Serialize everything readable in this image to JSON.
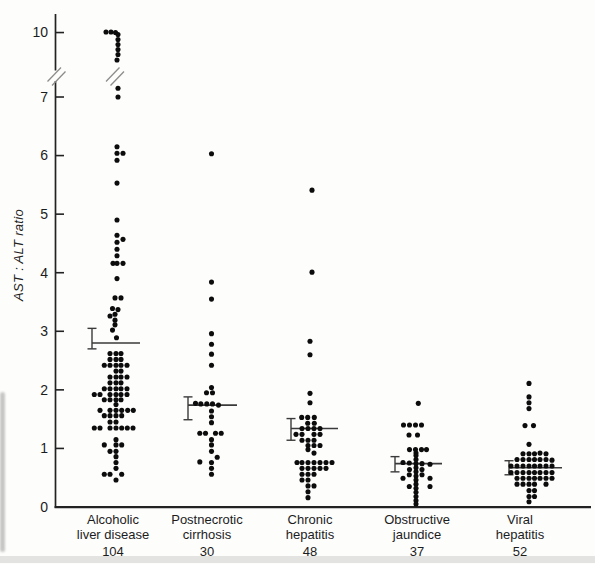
{
  "chart_data": {
    "type": "scatter",
    "title": "",
    "xlabel": "",
    "ylabel": "AST : ALT ratio",
    "ylim": [
      0,
      10.3
    ],
    "grid": false,
    "y_ticks": [
      10,
      7,
      6,
      5,
      4,
      3,
      2,
      1,
      0
    ],
    "axis_break": {
      "between": [
        7,
        10
      ]
    },
    "legend": "none",
    "groups": [
      {
        "label": [
          "Alcoholic",
          "liver disease"
        ],
        "n": "104",
        "label_x": 113,
        "center_x": 116,
        "mean": 2.8,
        "err_low": 2.7,
        "err_high": 3.05,
        "errorbar_x": 92,
        "mean_line_end_x": 140,
        "points": [
          [
            -10,
            10.05
          ],
          [
            -5,
            10.05
          ],
          [
            -0.5,
            10.0
          ],
          [
            2,
            9.82
          ],
          [
            2,
            9.37
          ],
          [
            2,
            8.91
          ],
          [
            2,
            8.46
          ],
          [
            2,
            8.0
          ],
          [
            1,
            7.5
          ],
          [
            2,
            7.15
          ],
          [
            2,
            7.0
          ],
          [
            1,
            6.15
          ],
          [
            1,
            6.04
          ],
          [
            7,
            6.04
          ],
          [
            1,
            5.92
          ],
          [
            1,
            5.53
          ],
          [
            1,
            4.9
          ],
          [
            1,
            4.64
          ],
          [
            7,
            4.57
          ],
          [
            1,
            4.52
          ],
          [
            1,
            4.4
          ],
          [
            1,
            4.29
          ],
          [
            -3,
            4.16
          ],
          [
            1,
            4.16
          ],
          [
            7,
            4.16
          ],
          [
            1,
            3.9
          ],
          [
            -1,
            3.57
          ],
          [
            5,
            3.57
          ],
          [
            -3.5,
            3.39
          ],
          [
            2,
            3.37
          ],
          [
            -1,
            3.29
          ],
          [
            -6,
            3.26
          ],
          [
            -1,
            3.19
          ],
          [
            -1,
            3.11
          ],
          [
            -3.5,
            3.02
          ],
          [
            0.5,
            2.89
          ],
          [
            -6,
            2.62
          ],
          [
            0,
            2.62
          ],
          [
            5,
            2.62
          ],
          [
            -6,
            2.52
          ],
          [
            0,
            2.52
          ],
          [
            5,
            2.52
          ],
          [
            -11.7,
            2.42
          ],
          [
            -6,
            2.42
          ],
          [
            0,
            2.42
          ],
          [
            5,
            2.42
          ],
          [
            11,
            2.42
          ],
          [
            0,
            2.32
          ],
          [
            5,
            2.32
          ],
          [
            -6,
            2.22
          ],
          [
            0,
            2.22
          ],
          [
            5,
            2.22
          ],
          [
            11,
            2.22
          ],
          [
            -6,
            2.12
          ],
          [
            0,
            2.12
          ],
          [
            5,
            2.12
          ],
          [
            -11.7,
            2.02
          ],
          [
            -6,
            2.02
          ],
          [
            0,
            2.02
          ],
          [
            5,
            2.02
          ],
          [
            11,
            2.02
          ],
          [
            -21.7,
            1.92
          ],
          [
            -16,
            1.92
          ],
          [
            -6,
            1.92
          ],
          [
            0,
            1.92
          ],
          [
            5,
            1.92
          ],
          [
            11,
            1.92
          ],
          [
            -11.7,
            1.83
          ],
          [
            -6,
            1.83
          ],
          [
            0,
            1.83
          ],
          [
            5,
            1.83
          ],
          [
            0,
            1.75
          ],
          [
            -16,
            1.65
          ],
          [
            -6,
            1.65
          ],
          [
            0,
            1.65
          ],
          [
            5.7,
            1.65
          ],
          [
            11.7,
            1.65
          ],
          [
            17.3,
            1.65
          ],
          [
            -11.7,
            1.56
          ],
          [
            -6,
            1.56
          ],
          [
            0,
            1.56
          ],
          [
            5.7,
            1.56
          ],
          [
            -6,
            1.45
          ],
          [
            0,
            1.45
          ],
          [
            -21.7,
            1.35
          ],
          [
            -16,
            1.35
          ],
          [
            -6,
            1.35
          ],
          [
            0,
            1.35
          ],
          [
            5.7,
            1.35
          ],
          [
            11.3,
            1.35
          ],
          [
            17,
            1.35
          ],
          [
            0,
            1.15
          ],
          [
            -11.7,
            1.06
          ],
          [
            0,
            1.06
          ],
          [
            5.7,
            1.06
          ],
          [
            -6,
            0.95
          ],
          [
            0,
            0.95
          ],
          [
            0,
            0.86
          ],
          [
            0,
            0.76
          ],
          [
            0,
            0.66
          ],
          [
            -11.7,
            0.56
          ],
          [
            -6,
            0.56
          ],
          [
            5.7,
            0.56
          ],
          [
            0,
            0.46
          ]
        ]
      },
      {
        "label": [
          "Postnecrotic",
          "cirrhosis"
        ],
        "n": "30",
        "label_x": 207,
        "center_x": 211.5,
        "mean": 1.74,
        "err_low": 1.49,
        "err_high": 1.88,
        "errorbar_x": 188,
        "mean_line_end_x": 237,
        "points": [
          [
            0,
            6.03
          ],
          [
            0,
            3.84
          ],
          [
            0,
            3.55
          ],
          [
            0,
            2.96
          ],
          [
            0,
            2.78
          ],
          [
            0,
            2.61
          ],
          [
            0,
            2.42
          ],
          [
            0,
            2.04
          ],
          [
            -5,
            1.95
          ],
          [
            1,
            1.95
          ],
          [
            -16,
            1.77
          ],
          [
            -10.7,
            1.76
          ],
          [
            -4.7,
            1.76
          ],
          [
            1,
            1.76
          ],
          [
            7,
            1.74
          ],
          [
            0,
            1.64
          ],
          [
            0,
            1.54
          ],
          [
            0,
            1.44
          ],
          [
            -11.7,
            1.26
          ],
          [
            -6,
            1.26
          ],
          [
            4,
            1.26
          ],
          [
            9.7,
            1.26
          ],
          [
            0,
            1.15
          ],
          [
            0,
            1.06
          ],
          [
            0,
            0.95
          ],
          [
            5.7,
            0.85
          ],
          [
            -11.7,
            0.77
          ],
          [
            0,
            0.76
          ],
          [
            0,
            0.66
          ],
          [
            0,
            0.56
          ]
        ]
      },
      {
        "label": [
          "Chronic",
          "hepatitis"
        ],
        "n": "48",
        "label_x": 310,
        "center_x": 311,
        "mean": 1.34,
        "err_low": 1.14,
        "err_high": 1.51,
        "errorbar_x": 291,
        "mean_line_end_x": 338,
        "points": [
          [
            1,
            5.41
          ],
          [
            1,
            4.01
          ],
          [
            -1,
            2.83
          ],
          [
            -1,
            2.6
          ],
          [
            -1,
            1.94
          ],
          [
            -1,
            1.78
          ],
          [
            -9.3,
            1.53
          ],
          [
            -3.3,
            1.53
          ],
          [
            3.3,
            1.53
          ],
          [
            -3.3,
            1.43
          ],
          [
            3.3,
            1.43
          ],
          [
            -9,
            1.34
          ],
          [
            -3,
            1.34
          ],
          [
            3,
            1.34
          ],
          [
            9,
            1.34
          ],
          [
            -15,
            1.24
          ],
          [
            -9,
            1.24
          ],
          [
            3,
            1.24
          ],
          [
            9,
            1.24
          ],
          [
            -9,
            1.14
          ],
          [
            -3,
            1.14
          ],
          [
            3,
            1.14
          ],
          [
            -3,
            1.05
          ],
          [
            3,
            1.05
          ],
          [
            9,
            1.05
          ],
          [
            -3,
            0.98
          ],
          [
            3,
            0.92
          ],
          [
            -14,
            0.76
          ],
          [
            -9,
            0.76
          ],
          [
            -3,
            0.76
          ],
          [
            3,
            0.76
          ],
          [
            9,
            0.76
          ],
          [
            15,
            0.76
          ],
          [
            21,
            0.76
          ],
          [
            -9,
            0.66
          ],
          [
            -3,
            0.66
          ],
          [
            3,
            0.66
          ],
          [
            9,
            0.66
          ],
          [
            15,
            0.66
          ],
          [
            -9,
            0.56
          ],
          [
            -3,
            0.56
          ],
          [
            3,
            0.56
          ],
          [
            -9,
            0.46
          ],
          [
            -3,
            0.46
          ],
          [
            -3,
            0.36
          ],
          [
            3,
            0.36
          ],
          [
            -3,
            0.26
          ],
          [
            -3,
            0.16
          ]
        ]
      },
      {
        "label": [
          "Obstructive",
          "jaundice"
        ],
        "n": "37",
        "label_x": 417,
        "center_x": 415.5,
        "mean": 0.74,
        "err_low": 0.6,
        "err_high": 0.86,
        "errorbar_x": 395,
        "mean_line_end_x": 442,
        "points": [
          [
            2.8,
            1.77
          ],
          [
            -12,
            1.4
          ],
          [
            -6,
            1.4
          ],
          [
            0,
            1.4
          ],
          [
            6,
            1.4
          ],
          [
            -6.5,
            1.23
          ],
          [
            2,
            1.23
          ],
          [
            -6,
            0.98
          ],
          [
            0,
            0.98
          ],
          [
            6,
            0.98
          ],
          [
            11,
            0.98
          ],
          [
            0.5,
            0.92
          ],
          [
            0.5,
            0.88
          ],
          [
            0.5,
            0.81
          ],
          [
            0.5,
            0.74
          ],
          [
            0.5,
            0.67
          ],
          [
            0.5,
            0.6
          ],
          [
            0.5,
            0.53
          ],
          [
            0.5,
            0.46
          ],
          [
            0.5,
            0.39
          ],
          [
            0.5,
            0.32
          ],
          [
            0.5,
            0.25
          ],
          [
            0.5,
            0.18
          ],
          [
            0.5,
            0.11
          ],
          [
            0.5,
            0.05
          ],
          [
            -12.5,
            0.76
          ],
          [
            -6.2,
            0.75
          ],
          [
            6.5,
            0.74
          ],
          [
            14.5,
            0.73
          ],
          [
            -6,
            0.64
          ],
          [
            6.5,
            0.64
          ],
          [
            -6.2,
            0.55
          ],
          [
            6.5,
            0.55
          ],
          [
            -12.5,
            0.49
          ],
          [
            14.5,
            0.49
          ],
          [
            -6.2,
            0.35
          ],
          [
            14.5,
            0.35
          ]
        ]
      },
      {
        "label": [
          "Viral",
          "hepatitis"
        ],
        "n": "52",
        "label_x": 520,
        "center_x": 529,
        "mean": 0.67,
        "err_low": 0.55,
        "err_high": 0.79,
        "errorbar_x": 509,
        "mean_line_end_x": 562,
        "points": [
          [
            0,
            2.11
          ],
          [
            0,
            1.88
          ],
          [
            0,
            1.78
          ],
          [
            0,
            1.68
          ],
          [
            -4,
            1.39
          ],
          [
            4.5,
            1.39
          ],
          [
            0,
            1.07
          ],
          [
            -6,
            0.91
          ],
          [
            0,
            0.91
          ],
          [
            5.5,
            0.91
          ],
          [
            11,
            0.92
          ],
          [
            17,
            0.91
          ],
          [
            -12,
            0.81
          ],
          [
            -6,
            0.81
          ],
          [
            0,
            0.81
          ],
          [
            5.5,
            0.81
          ],
          [
            11,
            0.81
          ],
          [
            17,
            0.81
          ],
          [
            23,
            0.8
          ],
          [
            -18,
            0.7
          ],
          [
            -12,
            0.7
          ],
          [
            -6,
            0.7
          ],
          [
            0,
            0.7
          ],
          [
            5.5,
            0.7
          ],
          [
            11,
            0.7
          ],
          [
            17,
            0.7
          ],
          [
            23,
            0.7
          ],
          [
            -18,
            0.59
          ],
          [
            -12,
            0.59
          ],
          [
            -6,
            0.59
          ],
          [
            0,
            0.59
          ],
          [
            5.5,
            0.59
          ],
          [
            11,
            0.59
          ],
          [
            17,
            0.59
          ],
          [
            23,
            0.59
          ],
          [
            -12,
            0.49
          ],
          [
            -6,
            0.49
          ],
          [
            0,
            0.49
          ],
          [
            5.5,
            0.49
          ],
          [
            11,
            0.49
          ],
          [
            17,
            0.49
          ],
          [
            23,
            0.49
          ],
          [
            -12,
            0.39
          ],
          [
            -6,
            0.39
          ],
          [
            0,
            0.39
          ],
          [
            5.5,
            0.39
          ],
          [
            17,
            0.39
          ],
          [
            0,
            0.28
          ],
          [
            5.5,
            0.28
          ],
          [
            0,
            0.18
          ],
          [
            5.5,
            0.18
          ],
          [
            0,
            0.09
          ]
        ]
      }
    ],
    "style": {
      "dot_color": "#0c0c0c",
      "axis_color": "#222222",
      "mean_line_color": "#3a3a3a",
      "break_mark_color": "#8c8c8c",
      "text_color": "#1c1c1c",
      "background": "#fdfdfc"
    }
  }
}
